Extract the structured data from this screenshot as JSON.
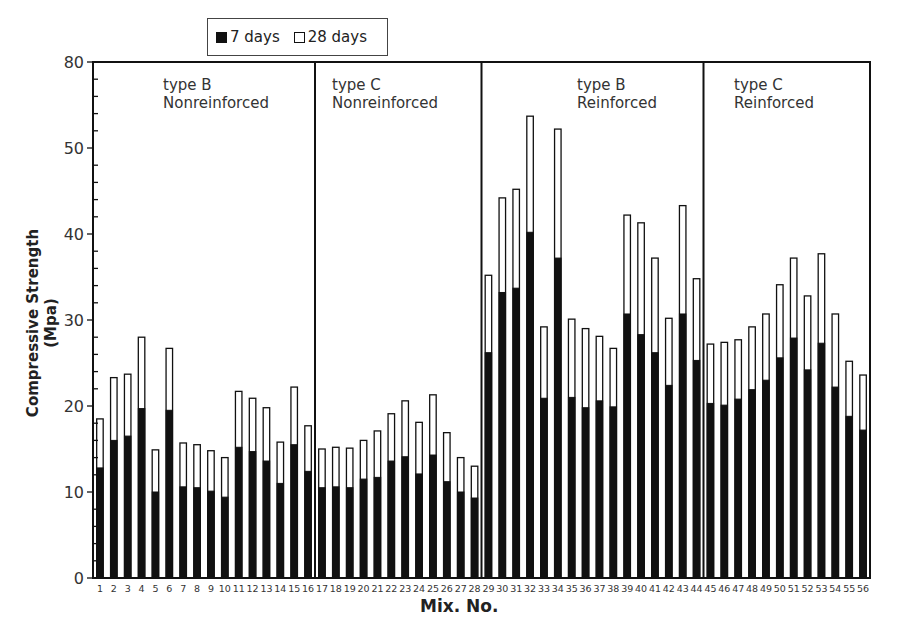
{
  "chart_data": {
    "type": "bar",
    "stacked": "overlay",
    "title": "",
    "xlabel": "Mix. No.",
    "ylabel": "Compressive Strength (Mpa)",
    "ylim": [
      0,
      60
    ],
    "y_ticks": [
      {
        "value": 0,
        "label": "0"
      },
      {
        "value": 10,
        "label": "10"
      },
      {
        "value": 20,
        "label": "20"
      },
      {
        "value": 30,
        "label": "30"
      },
      {
        "value": 40,
        "label": "40"
      },
      {
        "value": 50,
        "label": "50"
      },
      {
        "value": 60,
        "label": "80"
      }
    ],
    "grid": false,
    "legend": {
      "position": "top",
      "entries": [
        "7 days",
        "28 days"
      ]
    },
    "categories": [
      "1",
      "2",
      "3",
      "4",
      "5",
      "6",
      "7",
      "8",
      "9",
      "10",
      "11",
      "12",
      "13",
      "14",
      "15",
      "16",
      "17",
      "18",
      "19",
      "20",
      "21",
      "22",
      "23",
      "24",
      "25",
      "26",
      "27",
      "28",
      "29",
      "30",
      "31",
      "32",
      "33",
      "34",
      "35",
      "36",
      "37",
      "38",
      "39",
      "40",
      "41",
      "42",
      "43",
      "44",
      "45",
      "46",
      "47",
      "48",
      "49",
      "50",
      "51",
      "52",
      "53",
      "54",
      "55",
      "56"
    ],
    "series": [
      {
        "name": "7 days",
        "color": "#111111",
        "values": [
          12.8,
          16.0,
          16.5,
          19.7,
          10.0,
          19.5,
          10.6,
          10.5,
          10.1,
          9.4,
          15.2,
          14.7,
          13.6,
          11.0,
          15.5,
          12.4,
          10.5,
          10.6,
          10.5,
          11.5,
          11.7,
          13.6,
          14.1,
          12.1,
          14.3,
          11.2,
          10.0,
          9.3,
          26.2,
          33.2,
          33.7,
          40.2,
          20.9,
          37.2,
          21.0,
          19.8,
          20.6,
          19.9,
          30.7,
          28.3,
          26.2,
          22.4,
          30.7,
          25.3,
          20.3,
          20.1,
          20.8,
          21.9,
          23.0,
          25.6,
          27.9,
          24.2,
          27.3,
          22.2,
          18.8,
          17.2
        ]
      },
      {
        "name": "28 days",
        "color": "#ffffff",
        "values": [
          18.5,
          23.3,
          23.7,
          28.0,
          14.9,
          26.7,
          15.7,
          15.5,
          14.8,
          14.0,
          21.7,
          20.9,
          19.8,
          15.8,
          22.2,
          17.7,
          15.0,
          15.2,
          15.1,
          16.0,
          17.1,
          19.1,
          20.6,
          18.1,
          21.3,
          16.9,
          14.0,
          13.0,
          35.2,
          44.2,
          45.2,
          53.7,
          29.2,
          52.2,
          30.1,
          29.0,
          28.1,
          26.7,
          42.2,
          41.3,
          37.2,
          30.2,
          43.3,
          34.8,
          27.2,
          27.4,
          27.7,
          29.2,
          30.7,
          34.1,
          37.2,
          32.8,
          37.7,
          30.7,
          25.2,
          23.6
        ]
      }
    ],
    "groups": [
      {
        "label_line1": "type B",
        "label_line2": "Nonreinforced",
        "mixes": [
          1,
          16
        ]
      },
      {
        "label_line1": "type C",
        "label_line2": "Nonreinforced",
        "mixes": [
          17,
          28
        ]
      },
      {
        "label_line1": "type B",
        "label_line2": "Reinforced",
        "mixes": [
          29,
          44
        ]
      },
      {
        "label_line1": "type C",
        "label_line2": "Reinforced",
        "mixes": [
          45,
          56
        ]
      }
    ]
  },
  "legend": {
    "item1": "7 days",
    "item2": "28 days"
  },
  "axes": {
    "xlabel": "Mix. No.",
    "ylabel": "Compressive Strength (Mpa)"
  }
}
